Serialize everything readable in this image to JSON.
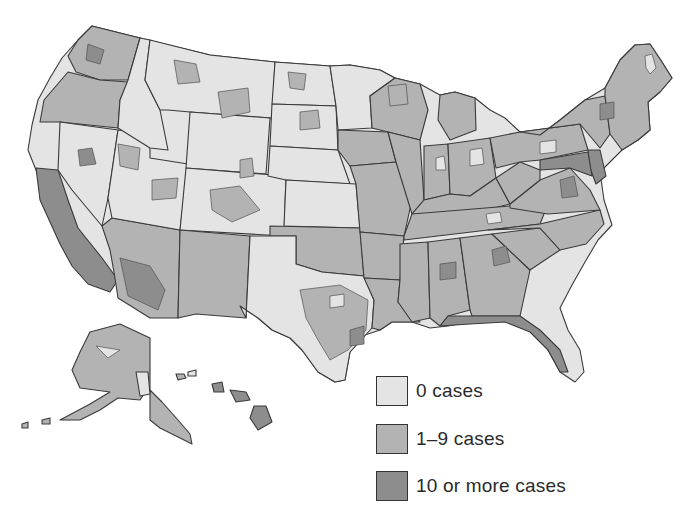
{
  "map": {
    "subject": "United States counties by number of cases",
    "classes": [
      {
        "id": "none",
        "label": "0 cases",
        "color": "#e4e4e4"
      },
      {
        "id": "low",
        "label": "1–9 cases",
        "color": "#b3b3b3"
      },
      {
        "id": "high",
        "label": "10 or more cases",
        "color": "#8d8d8d"
      }
    ],
    "outline_color": "#3a3a3a",
    "insets": [
      "Alaska",
      "Hawaii"
    ]
  },
  "legend": {
    "items": [
      {
        "label": "0 cases",
        "color": "#e4e4e4"
      },
      {
        "label": "1–9 cases",
        "color": "#b3b3b3"
      },
      {
        "label": "10 or more cases",
        "color": "#8d8d8d"
      }
    ]
  }
}
